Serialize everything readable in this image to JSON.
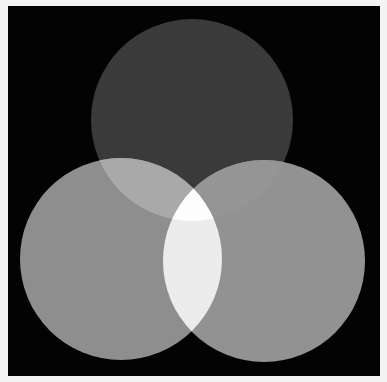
{
  "canvas": {
    "width": 387,
    "height": 382,
    "border_color": "#f4f4f4",
    "background": {
      "x": 8,
      "y": 6,
      "width": 372,
      "height": 370,
      "color": "#030303"
    }
  },
  "diagram": {
    "type": "venn-3-circle",
    "circles": [
      {
        "id": "top",
        "cx": 192,
        "cy": 120,
        "r": 101,
        "color": "#3a3a3a"
      },
      {
        "id": "left",
        "cx": 121,
        "cy": 259,
        "r": 101,
        "color": "#8e8e8e"
      },
      {
        "id": "right",
        "cx": 264,
        "cy": 261,
        "r": 101,
        "color": "#929292"
      }
    ],
    "overlaps": {
      "top_left": "#a9a9a9",
      "top_right": "#959595",
      "left_right": "#ececec",
      "all_three": "#fdfdfd"
    }
  }
}
